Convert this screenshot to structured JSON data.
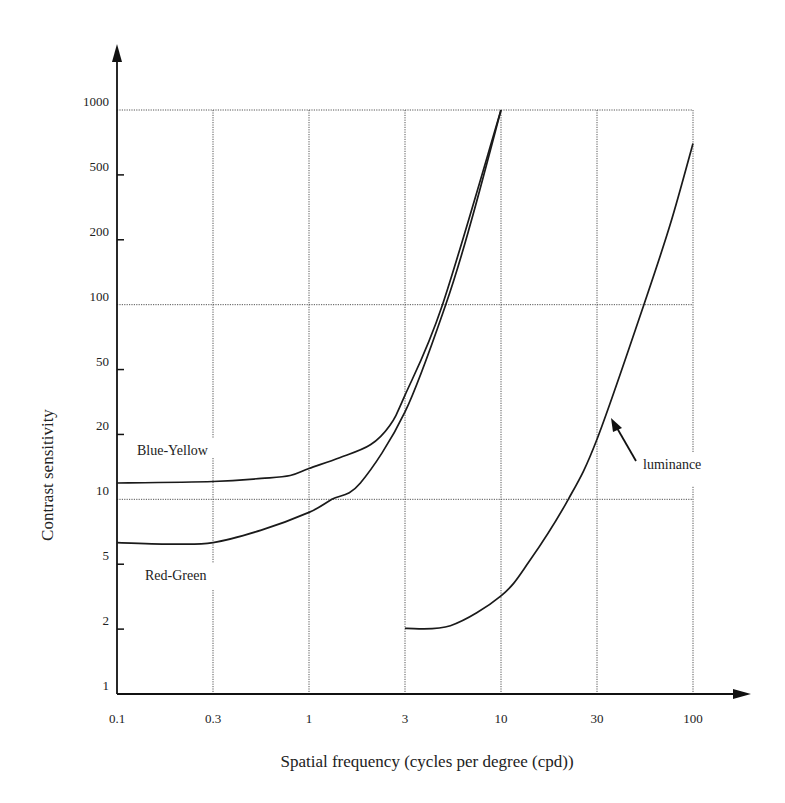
{
  "chart_data": {
    "type": "line",
    "title": "",
    "xlabel": "Spatial frequency (cycles per degree (cpd))",
    "ylabel": "Contrast sensitivity",
    "xscale": "log",
    "yscale": "log",
    "xlim": [
      0.1,
      100
    ],
    "ylim": [
      1,
      1000
    ],
    "x_ticks": [
      0.1,
      0.3,
      1,
      3,
      10,
      30,
      100
    ],
    "x_tick_labels": [
      "0.1",
      "0.3",
      "1",
      "3",
      "10",
      "30",
      "100"
    ],
    "y_ticks": [
      1,
      2,
      5,
      10,
      20,
      50,
      100,
      200,
      500,
      1000
    ],
    "y_tick_labels": [
      "1",
      "2",
      "5",
      "10",
      "20",
      "50",
      "100",
      "200",
      "500",
      "1000"
    ],
    "grid": {
      "vertical_at": [
        0.3,
        1,
        3,
        10,
        30,
        100
      ],
      "horizontal_at": [
        10,
        100,
        1000
      ]
    },
    "legend": "inline labels",
    "series": [
      {
        "name": "Blue-Yellow",
        "points": [
          [
            0.1,
            11.9
          ],
          [
            0.3,
            12.1
          ],
          [
            0.55,
            12.5
          ],
          [
            0.79,
            12.9
          ],
          [
            1.0,
            13.9
          ],
          [
            1.42,
            15.6
          ],
          [
            2.02,
            17.9
          ],
          [
            2.52,
            22.7
          ],
          [
            3.0,
            34.8
          ],
          [
            4.8,
            100
          ],
          [
            10.0,
            1000
          ]
        ]
      },
      {
        "name": "Red-Green",
        "points": [
          [
            0.1,
            6.3
          ],
          [
            0.19,
            6.2
          ],
          [
            0.3,
            6.3
          ],
          [
            0.55,
            7.2
          ],
          [
            1.0,
            8.7
          ],
          [
            1.3,
            10
          ],
          [
            1.8,
            11.9
          ],
          [
            3.0,
            27.5
          ],
          [
            5.0,
            100
          ],
          [
            6.8,
            247
          ],
          [
            10.0,
            1000
          ]
        ]
      },
      {
        "name": "luminance",
        "points": [
          [
            3.0,
            2.02
          ],
          [
            5.3,
            2.1
          ],
          [
            10.0,
            3.2
          ],
          [
            13.9,
            5.2
          ],
          [
            21.6,
            10
          ],
          [
            30.0,
            19
          ],
          [
            54,
            100
          ],
          [
            75,
            247
          ],
          [
            100,
            700
          ]
        ]
      }
    ],
    "annotations": [
      {
        "text": "Blue-Yellow",
        "near": [
          0.25,
          16
        ]
      },
      {
        "text": "Red-Green",
        "near": [
          0.25,
          4
        ]
      },
      {
        "text": "luminance",
        "near": [
          60,
          15
        ],
        "arrow_to": [
          37,
          28
        ]
      }
    ]
  },
  "labels": {
    "blue_yellow": "Blue-Yellow",
    "red_green": "Red-Green",
    "luminance": "luminance"
  }
}
